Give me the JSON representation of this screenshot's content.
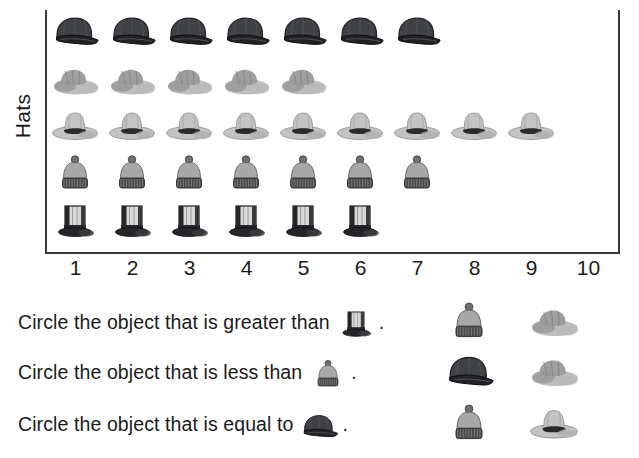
{
  "worksheet": {
    "type": "pictograph-comparison",
    "y_axis_label": "Hats"
  },
  "chart_data": {
    "type": "bar",
    "title": "",
    "xlabel": "",
    "ylabel": "Hats",
    "orientation": "horizontal",
    "pictograph": true,
    "xlim": [
      0,
      10
    ],
    "grid": false,
    "legend": "none",
    "categories": [
      "baseball cap",
      "sun hat",
      "cowboy hat",
      "beanie",
      "top hat"
    ],
    "values": [
      7,
      5,
      9,
      7,
      6
    ],
    "tick_labels": [
      "1",
      "2",
      "3",
      "4",
      "5",
      "6",
      "7",
      "8",
      "9",
      "10"
    ],
    "rows": [
      {
        "icon": "baseball-cap-icon",
        "label": "baseball cap",
        "count": 7
      },
      {
        "icon": "sun-hat-icon",
        "label": "sun hat",
        "count": 5
      },
      {
        "icon": "cowboy-hat-icon",
        "label": "cowboy hat",
        "count": 9
      },
      {
        "icon": "beanie-icon",
        "label": "beanie",
        "count": 7
      },
      {
        "icon": "top-hat-icon",
        "label": "top hat",
        "count": 6
      }
    ]
  },
  "questions": [
    {
      "prefix": "Circle the object that is greater than",
      "subject_icon": "top-hat-icon",
      "suffix": ".",
      "options": [
        "beanie-icon",
        "sun-hat-icon"
      ]
    },
    {
      "prefix": "Circle the object that is less than",
      "subject_icon": "beanie-icon",
      "suffix": ".",
      "options": [
        "baseball-cap-icon",
        "sun-hat-icon"
      ]
    },
    {
      "prefix": "Circle the object that is equal to",
      "subject_icon": "baseball-cap-icon",
      "suffix": ".",
      "options": [
        "beanie-icon",
        "cowboy-hat-icon"
      ]
    }
  ],
  "colors": {
    "ink": "#1b1b1b",
    "axis": "#39393b",
    "cap_dark": "#3f4145",
    "cap_darker": "#212225",
    "sunhat_light": "#b9b9b9",
    "sunhat_mid": "#9a9a9a",
    "cowboy_light": "#c3c3c3",
    "cowboy_band": "#2b2b2b",
    "beanie_body": "#a8a8a8",
    "beanie_brim": "#4a4a4a",
    "tophat_body": "#d8d8d8",
    "tophat_dark": "#26262a",
    "background": "#ffffff"
  }
}
